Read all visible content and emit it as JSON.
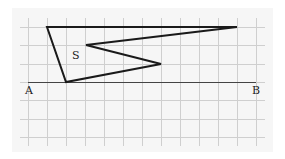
{
  "diagram": {
    "panel": {
      "x": 12,
      "y": 8,
      "width": 261,
      "height": 144,
      "fill": "#f6f6f6"
    },
    "grid": {
      "color": "#cfcfcf",
      "vertical_x": [
        28,
        47,
        66,
        85,
        104,
        123,
        142,
        161,
        180,
        199,
        218,
        237,
        256
      ],
      "horizontal_y": [
        27,
        45,
        64,
        82,
        100,
        119,
        137
      ],
      "x_start": 20,
      "x_end": 265,
      "y_start": 18,
      "y_end": 146
    },
    "segment_ab": {
      "from": {
        "x": 28,
        "y": 82
      },
      "to": {
        "x": 256,
        "y": 82
      },
      "color": "#444444"
    },
    "shape_s": {
      "points": [
        {
          "x": 47,
          "y": 27
        },
        {
          "x": 237,
          "y": 27
        },
        {
          "x": 86,
          "y": 45
        },
        {
          "x": 161,
          "y": 64
        },
        {
          "x": 66,
          "y": 82
        }
      ],
      "stroke": "#1a1a1a"
    },
    "labels": {
      "a": {
        "text": "A",
        "x": 25,
        "y": 94
      },
      "b": {
        "text": "B",
        "x": 252,
        "y": 94
      },
      "s": {
        "text": "S",
        "x": 72,
        "y": 59
      }
    }
  }
}
